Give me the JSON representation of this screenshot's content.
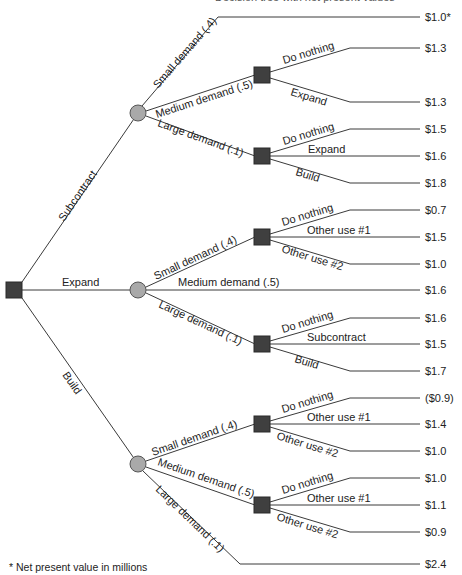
{
  "title": "Decision tree with net present values",
  "footnote": "* Net present value in millions",
  "root": {
    "type": "decision",
    "branches": [
      {
        "label": "Subcontract",
        "chance": {
          "branches": [
            {
              "label": "Small demand (.4)",
              "payoff": "$1.0*"
            },
            {
              "label": "Medium demand (.5)",
              "decision": [
                {
                  "label": "Do nothing",
                  "payoff": "$1.3"
                },
                {
                  "label": "Expand",
                  "payoff": "$1.3"
                }
              ]
            },
            {
              "label": "Large demand (.1)",
              "decision": [
                {
                  "label": "Do nothing",
                  "payoff": "$1.5"
                },
                {
                  "label": "Expand",
                  "payoff": "$1.6"
                },
                {
                  "label": "Build",
                  "payoff": "$1.8"
                }
              ]
            }
          ]
        }
      },
      {
        "label": "Expand",
        "chance": {
          "branches": [
            {
              "label": "Small demand (.4)",
              "decision": [
                {
                  "label": "Do nothing",
                  "payoff": "$0.7"
                },
                {
                  "label": "Other use #1",
                  "payoff": "$1.5"
                },
                {
                  "label": "Other use #2",
                  "payoff": "$1.0"
                }
              ]
            },
            {
              "label": "Medium demand (.5)",
              "payoff": "$1.6"
            },
            {
              "label": "Large demand (.1)",
              "decision": [
                {
                  "label": "Do nothing",
                  "payoff": "$1.6"
                },
                {
                  "label": "Subcontract",
                  "payoff": "$1.5"
                },
                {
                  "label": "Build",
                  "payoff": "$1.7"
                }
              ]
            }
          ]
        }
      },
      {
        "label": "Build",
        "chance": {
          "branches": [
            {
              "label": "Small demand (.4)",
              "decision": [
                {
                  "label": "Do nothing",
                  "payoff": "($0.9)"
                },
                {
                  "label": "Other use #1",
                  "payoff": "$1.4"
                },
                {
                  "label": "Other use #2",
                  "payoff": "$1.0"
                }
              ]
            },
            {
              "label": "Medium demand (.5)",
              "decision": [
                {
                  "label": "Do nothing",
                  "payoff": "$1.0"
                },
                {
                  "label": "Other use #1",
                  "payoff": "$1.1"
                },
                {
                  "label": "Other use #2",
                  "payoff": "$0.9"
                }
              ]
            },
            {
              "label": "Large demand (.1)",
              "payoff": "$2.4"
            }
          ]
        }
      }
    ]
  },
  "labels": {
    "root_subcontract": "Subcontract",
    "root_expand": "Expand",
    "root_build": "Build",
    "s_small": "Small demand (.4)",
    "s_medium": "Medium demand (.5)",
    "s_large": "Large demand (.1)",
    "s_med_do": "Do nothing",
    "s_med_expand": "Expand",
    "s_lg_do": "Do nothing",
    "s_lg_expand": "Expand",
    "s_lg_build": "Build",
    "e_small": "Small demand (.4)",
    "e_medium": "Medium demand (.5)",
    "e_large": "Large demand (.1)",
    "e_sm_do": "Do nothing",
    "e_sm_u1": "Other use #1",
    "e_sm_u2": "Other use #2",
    "e_lg_do": "Do nothing",
    "e_lg_sub": "Subcontract",
    "e_lg_build": "Build",
    "b_small": "Small demand (.4)",
    "b_medium": "Medium demand (.5)",
    "b_large": "Large demand (.1)",
    "b_sm_do": "Do nothing",
    "b_sm_u1": "Other use #1",
    "b_sm_u2": "Other use #2",
    "b_md_do": "Do nothing",
    "b_md_u1": "Other use #1",
    "b_md_u2": "Other use #2"
  },
  "payoffs": [
    "$1.0*",
    "$1.3",
    "$1.3",
    "$1.5",
    "$1.6",
    "$1.8",
    "$0.7",
    "$1.5",
    "$1.0",
    "$1.6",
    "$1.6",
    "$1.5",
    "$1.7",
    "($0.9)",
    "$1.4",
    "$1.0",
    "$1.0",
    "$1.1",
    "$0.9",
    "$2.4"
  ]
}
